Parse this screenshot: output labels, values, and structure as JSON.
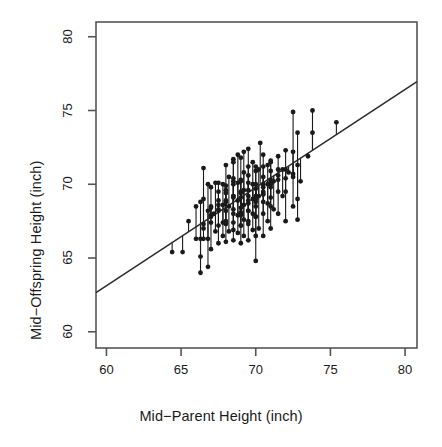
{
  "chart_data": {
    "type": "scatter",
    "title": "",
    "xlabel": "Mid−Parent Height (inch)",
    "ylabel": "Mid−Offspring Height (inch)",
    "xlim": [
      59.3,
      80.8
    ],
    "ylim": [
      58.9,
      81.0
    ],
    "xticks": [
      60,
      65,
      70,
      75,
      80
    ],
    "yticks": [
      60,
      65,
      70,
      75,
      80
    ],
    "xtick_labels": [
      "60",
      "65",
      "70",
      "75",
      "80"
    ],
    "ytick_labels": [
      "60",
      "65",
      "70",
      "75",
      "80"
    ],
    "grid": false,
    "legend": null,
    "point_color": "#1a1a1a",
    "point_shape": "filled-circle",
    "point_radius_px": 2.4,
    "line_color": "#2b2b2b",
    "box_color": "#555555",
    "background": "#ffffff",
    "annotations": [
      "vertical residual segments drawn from each point to the fitted line"
    ],
    "series": [
      {
        "name": "Galton mid-parent vs mid-offspring height",
        "x": [
          65.1,
          64.4,
          65.5,
          66.3,
          66.3,
          66.3,
          66.3,
          66.5,
          66.5,
          66.5,
          66.8,
          66.8,
          66.8,
          66.8,
          67.0,
          67.0,
          67.0,
          67.2,
          67.3,
          67.3,
          67.5,
          67.5,
          67.5,
          67.5,
          67.5,
          67.8,
          67.8,
          67.8,
          67.8,
          68.0,
          68.0,
          68.0,
          68.0,
          68.0,
          68.2,
          68.2,
          68.2,
          68.5,
          68.5,
          68.5,
          68.5,
          68.5,
          68.5,
          68.8,
          68.8,
          68.8,
          68.8,
          68.8,
          69.0,
          69.0,
          69.0,
          69.0,
          69.0,
          69.0,
          69.2,
          69.2,
          69.2,
          69.2,
          69.2,
          69.2,
          69.5,
          69.5,
          69.5,
          69.5,
          69.5,
          69.5,
          69.5,
          69.8,
          69.8,
          69.8,
          69.8,
          69.8,
          70.0,
          70.0,
          70.0,
          70.0,
          70.0,
          70.0,
          70.2,
          70.2,
          70.2,
          70.3,
          70.5,
          70.5,
          70.5,
          70.5,
          70.5,
          70.8,
          70.8,
          70.8,
          70.8,
          71.0,
          71.0,
          71.0,
          71.0,
          71.2,
          71.2,
          71.5,
          71.5,
          71.5,
          71.8,
          71.8,
          72.0,
          72.0,
          72.2,
          72.5,
          72.5,
          72.5,
          72.5,
          72.8,
          72.8,
          72.8,
          72.8,
          73.0,
          73.5,
          73.8,
          73.8,
          75.4,
          66.0,
          66.0,
          67.0,
          67.5,
          68.0,
          68.5,
          69.0,
          69.5,
          70.0,
          70.5,
          71.0,
          71.5,
          68.0,
          68.5,
          69.0,
          69.5,
          70.0,
          70.5,
          71.0,
          66.5,
          67.0,
          67.5,
          68.0,
          68.5,
          69.0,
          69.5,
          70.0,
          70.5,
          71.0,
          71.5,
          72.0,
          69.0,
          69.5,
          70.0,
          70.5,
          71.0,
          68.5,
          69.0,
          69.5,
          70.0,
          67.5,
          68.0,
          68.5,
          69.0,
          70.5,
          71.0,
          72.0,
          72.5,
          66.5,
          67.0,
          69.5,
          70.0,
          70.5,
          68.0,
          68.5,
          72.0,
          71.5,
          67.0,
          69.0,
          70.0,
          68.5,
          71.0
        ],
        "y": [
          65.4,
          65.4,
          67.5,
          66.3,
          64.0,
          65.1,
          68.8,
          66.3,
          69.0,
          71.1,
          66.3,
          64.4,
          68.2,
          70.0,
          65.6,
          67.9,
          69.8,
          68.0,
          66.8,
          70.1,
          66.0,
          67.2,
          68.3,
          69.5,
          70.1,
          66.5,
          67.4,
          68.6,
          70.0,
          66.1,
          67.3,
          68.2,
          69.4,
          71.3,
          66.8,
          68.5,
          70.5,
          66.2,
          67.4,
          68.3,
          69.2,
          70.4,
          71.7,
          66.7,
          67.9,
          68.9,
          70.1,
          72.0,
          66.0,
          67.2,
          68.1,
          69.1,
          70.2,
          71.8,
          66.5,
          67.6,
          68.6,
          69.6,
          70.8,
          72.2,
          66.2,
          67.3,
          68.2,
          69.2,
          70.1,
          71.2,
          72.4,
          66.9,
          68.0,
          69.0,
          70.0,
          71.5,
          64.8,
          66.5,
          67.8,
          68.8,
          70.0,
          71.2,
          67.0,
          69.2,
          71.0,
          72.8,
          66.5,
          68.0,
          69.4,
          70.5,
          72.0,
          67.5,
          68.7,
          70.0,
          71.3,
          67.0,
          68.5,
          70.0,
          71.5,
          68.3,
          70.2,
          68.0,
          69.5,
          71.0,
          69.2,
          71.0,
          67.5,
          69.5,
          70.8,
          68.5,
          70.5,
          72.2,
          74.9,
          67.6,
          69.0,
          71.3,
          73.5,
          70.2,
          71.9,
          73.5,
          75.0,
          74.2,
          66.3,
          68.5,
          68.4,
          68.9,
          68.8,
          69.1,
          69.4,
          69.6,
          69.7,
          70.0,
          70.3,
          70.6,
          67.5,
          68.0,
          68.4,
          68.7,
          69.0,
          69.3,
          69.8,
          67.3,
          67.8,
          68.2,
          69.6,
          70.0,
          70.3,
          70.6,
          70.9,
          71.2,
          71.6,
          71.9,
          72.3,
          67.9,
          68.2,
          68.5,
          68.8,
          69.1,
          66.9,
          67.2,
          67.5,
          67.8,
          68.6,
          68.9,
          69.2,
          69.5,
          69.8,
          70.1,
          70.4,
          70.7,
          67.0,
          67.4,
          68.9,
          69.2,
          69.5,
          69.9,
          70.2,
          71.0,
          70.3,
          68.5,
          68.0,
          69.0,
          71.5,
          70.9
        ]
      }
    ],
    "fit_line": {
      "name": "least-squares regression line",
      "x0": 59.3,
      "y0": 62.65,
      "x1": 80.8,
      "y1": 76.95
    }
  },
  "axis": {
    "x_tick_values": [
      "60",
      "65",
      "70",
      "75",
      "80"
    ],
    "y_tick_values": [
      "60",
      "65",
      "70",
      "75",
      "80"
    ]
  }
}
